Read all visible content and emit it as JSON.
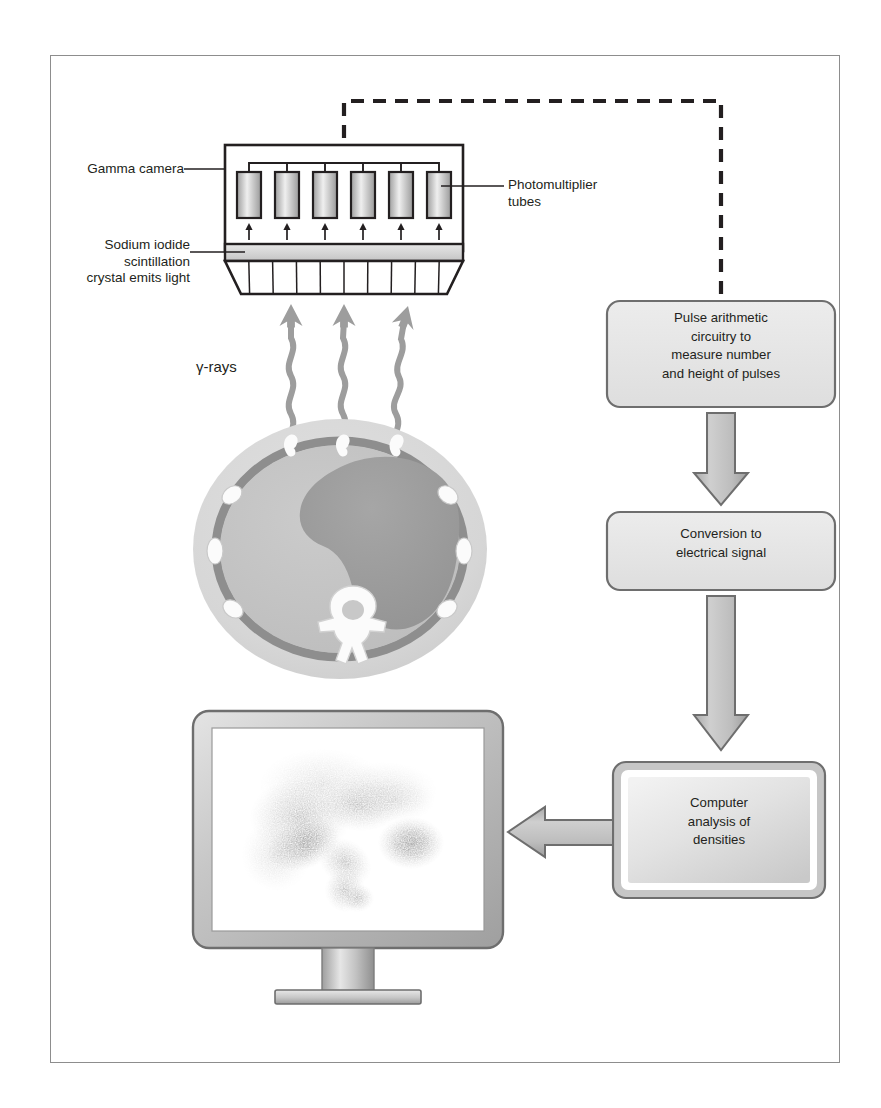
{
  "figure": {
    "type": "diagram",
    "background": "#ffffff",
    "border_color": "#8d8d8d"
  },
  "labels": {
    "gamma_camera": "Gamma camera",
    "sodium_iodide": "Sodium iodide\nscintillation\ncrystal emits light",
    "photomultiplier": "Photomultiplier\ntubes",
    "gamma_rays": "γ-rays"
  },
  "flow_boxes": [
    {
      "id": "pulse-arithmetic",
      "lines": [
        "Pulse arithmetic",
        "circuitry to",
        "measure number",
        "and height of pulses"
      ],
      "fill": "#e4e4e4",
      "stroke": "#6e6e6e"
    },
    {
      "id": "conversion",
      "lines": [
        "Conversion to",
        "electrical signal"
      ],
      "fill": "#e4e4e4",
      "stroke": "#6e6e6e"
    },
    {
      "id": "computer-analysis",
      "lines": [
        "Computer",
        "analysis of",
        "densities"
      ],
      "fill": "#dcdcdc",
      "stroke": "#6e6e6e"
    }
  ],
  "components": {
    "photomultiplier_tube_count": 6,
    "collimator_cell_count": 10,
    "gamma_ray_count": 3,
    "scintillation_arrow_count": 6
  },
  "colors": {
    "box_fill": "#e4e4e4",
    "box_stroke": "#6e6e6e",
    "arrow_fill": "#b9b9b9",
    "arrow_stroke": "#6e6e6e",
    "body_outer": "#d9d9d9",
    "body_cavity": "#c2c2c2",
    "liver": "#9b9b9b",
    "body_wall": "#8e8e8e",
    "bone_white": "#fbfbfb",
    "tube_fill": "#c8c8c8",
    "crystal_fill": "#dcdcdc",
    "monitor_bezel": "#c3c3c3",
    "screen": "#ffffff",
    "gamma_ray": "#9d9d9d",
    "outline": "#231f20"
  }
}
